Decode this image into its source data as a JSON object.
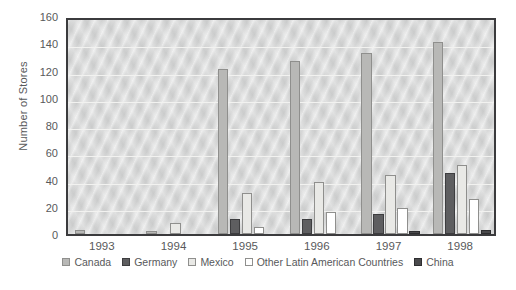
{
  "chart_data": {
    "type": "bar",
    "title": "",
    "xlabel": "",
    "ylabel": "Number of Stores",
    "ylim": [
      0,
      160
    ],
    "yticks": [
      0,
      20,
      40,
      60,
      80,
      100,
      120,
      140,
      160
    ],
    "grid": true,
    "legend_position": "bottom",
    "categories": [
      "1993",
      "1994",
      "1995",
      "1996",
      "1997",
      "1998"
    ],
    "series": [
      {
        "name": "Canada",
        "color": "#b8b8b6",
        "values": [
          3,
          2,
          121,
          127,
          133,
          141
        ]
      },
      {
        "name": "Germany",
        "color": "#5e5e60",
        "values": [
          0,
          0,
          11,
          11,
          15,
          45
        ]
      },
      {
        "name": "Mexico",
        "color": "#e9e9e6",
        "values": [
          0,
          8,
          30,
          38,
          43,
          51
        ]
      },
      {
        "name": "Other Latin American Countries",
        "color": "#ffffff",
        "values": [
          0,
          0,
          5,
          16,
          19,
          26
        ]
      },
      {
        "name": "China",
        "color": "#4a4a4c",
        "values": [
          0,
          0,
          0,
          0,
          2,
          3
        ]
      }
    ]
  },
  "axis": {
    "y_title": "Number of Stores"
  }
}
